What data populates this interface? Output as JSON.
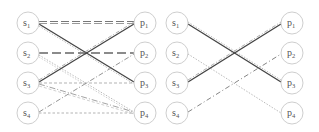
{
  "diagrams": [
    {
      "name": "left-bipartite-graph",
      "source_nodes": [
        {
          "id": "s1",
          "base": "s",
          "sub": "1"
        },
        {
          "id": "s2",
          "base": "s",
          "sub": "2"
        },
        {
          "id": "s3",
          "base": "s",
          "sub": "3"
        },
        {
          "id": "s4",
          "base": "s",
          "sub": "4"
        }
      ],
      "target_nodes": [
        {
          "id": "p1",
          "base": "p",
          "sub": "1"
        },
        {
          "id": "p2",
          "base": "p",
          "sub": "2"
        },
        {
          "id": "p3",
          "base": "p",
          "sub": "3"
        },
        {
          "id": "p4",
          "base": "p",
          "sub": "4"
        }
      ],
      "edges": [
        {
          "from": "s1",
          "to": "p1",
          "style": "long-dash-double"
        },
        {
          "from": "s1",
          "to": "p3",
          "style": "solid-dark-with-dotted"
        },
        {
          "from": "s2",
          "to": "p2",
          "style": "long-dash"
        },
        {
          "from": "s2",
          "to": "p4",
          "style": "dotted"
        },
        {
          "from": "s3",
          "to": "p1",
          "style": "solid-dark-with-dashdot"
        },
        {
          "from": "s3",
          "to": "p3",
          "style": "short-dash"
        },
        {
          "from": "s3",
          "to": "p4",
          "style": "dash-dot"
        },
        {
          "from": "s4",
          "to": "p2",
          "style": "dash-dot"
        },
        {
          "from": "s4",
          "to": "p4",
          "style": "short-dash"
        }
      ]
    },
    {
      "name": "right-bipartite-graph",
      "source_nodes": [
        {
          "id": "s1",
          "base": "s",
          "sub": "1"
        },
        {
          "id": "s2",
          "base": "s",
          "sub": "2"
        },
        {
          "id": "s3",
          "base": "s",
          "sub": "3"
        },
        {
          "id": "s4",
          "base": "s",
          "sub": "4"
        }
      ],
      "target_nodes": [
        {
          "id": "p1",
          "base": "p",
          "sub": "1"
        },
        {
          "id": "p2",
          "base": "p",
          "sub": "2"
        },
        {
          "id": "p3",
          "base": "p",
          "sub": "3"
        },
        {
          "id": "p4",
          "base": "p",
          "sub": "4"
        }
      ],
      "edges": [
        {
          "from": "s1",
          "to": "p3",
          "style": "solid-dark-with-dotted"
        },
        {
          "from": "s2",
          "to": "p4",
          "style": "dotted"
        },
        {
          "from": "s3",
          "to": "p1",
          "style": "solid-dark-with-dashdot"
        },
        {
          "from": "s4",
          "to": "p2",
          "style": "dash-dot"
        }
      ]
    }
  ]
}
